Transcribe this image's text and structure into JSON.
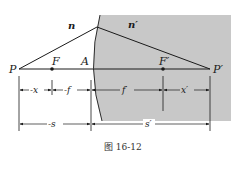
{
  "figure": {
    "caption": "图 16-12",
    "media_labels": {
      "left": "n",
      "right": "n′"
    },
    "points": {
      "P": "P",
      "F": "F",
      "A": "A",
      "F_prime": "F′",
      "P_prime": "P′"
    },
    "dimensions": {
      "x": "-x",
      "f": "-f",
      "f_prime": "f′",
      "x_prime": "x′",
      "s": "-s",
      "s_prime": "s′"
    },
    "colors": {
      "medium_fill": "#c8c8c8",
      "line": "#1a1a1a",
      "background": "#ffffff"
    }
  }
}
